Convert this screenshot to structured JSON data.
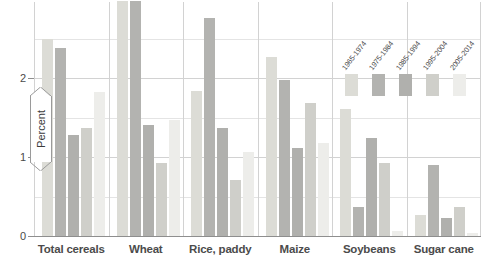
{
  "chart_data": {
    "type": "bar",
    "title": "",
    "subtitle": "",
    "xlabel": "",
    "ylabel": "Percent",
    "ylim": [
      0,
      3
    ],
    "yticks": [
      0,
      1,
      2
    ],
    "ytick_labels": [
      "0",
      "1",
      "2"
    ],
    "grid": true,
    "legend_position": "top-right",
    "categories": [
      "Total cereals",
      "Wheat",
      "Rice, paddy",
      "Maize",
      "Soybeans",
      "Sugar cane"
    ],
    "series": [
      {
        "name": "1965-1974",
        "color": "#dcdcd6",
        "values": [
          2.5,
          2.97,
          1.83,
          2.27,
          1.61,
          0.27
        ]
      },
      {
        "name": "1975-1984",
        "color": "#b3b3b0",
        "values": [
          2.38,
          2.97,
          2.76,
          1.98,
          0.37,
          0.9
        ]
      },
      {
        "name": "1985-1994",
        "color": "#b0b0ad",
        "values": [
          1.28,
          1.4,
          1.37,
          1.11,
          1.24,
          0.23
        ]
      },
      {
        "name": "1995-2004",
        "color": "#cfcfca",
        "values": [
          1.37,
          0.93,
          0.71,
          1.68,
          0.93,
          0.37
        ]
      },
      {
        "name": "2005-2014",
        "color": "#ededea",
        "values": [
          1.82,
          1.47,
          1.06,
          1.18,
          0.06,
          0.04
        ]
      }
    ]
  },
  "axis": {
    "y_label_banner": "Percent",
    "tick_0": "0",
    "tick_1": "1",
    "tick_2": "2"
  },
  "legend": {
    "items": [
      {
        "label": "1965-1974"
      },
      {
        "label": "1975-1984"
      },
      {
        "label": "1985-1994"
      },
      {
        "label": "1995-2004"
      },
      {
        "label": "2005-2014"
      }
    ]
  },
  "colors": {
    "gridline": "#d2d2d2",
    "axis": "#8e8e8e",
    "text": "#4b4b4b",
    "background": "#ffffff"
  }
}
